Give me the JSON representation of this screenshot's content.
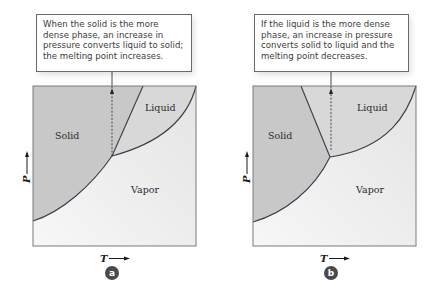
{
  "panels": [
    {
      "id": "a",
      "badge": "a",
      "callout": "When the solid is the more dense phase, an increase in pressure converts liquid to solid; the melting point increases.",
      "regions": {
        "solid": "Solid",
        "liquid": "Liquid",
        "vapor": "Vapor"
      },
      "axes": {
        "x": "T",
        "y": "P"
      },
      "melting_line_slope": "positive"
    },
    {
      "id": "b",
      "badge": "b",
      "callout": "If the liquid is the more dense phase, an increase in pressure converts solid to liquid and the melting point decreases.",
      "regions": {
        "solid": "Solid",
        "liquid": "Liquid",
        "vapor": "Vapor"
      },
      "axes": {
        "x": "T",
        "y": "P"
      },
      "melting_line_slope": "negative"
    }
  ],
  "colors": {
    "solid_fill": "#c9c9c9",
    "liquid_fill": "#d9d9d9",
    "vapor_fill": "#f1f1f1",
    "curve": "#3a3a4a",
    "badge": "#4a4a4a",
    "frame": "#7a7a7a"
  }
}
